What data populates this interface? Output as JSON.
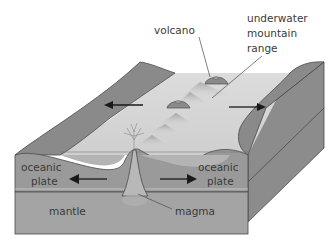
{
  "diagram": {
    "labels": {
      "volcano": "volcano",
      "mountain_range_line1": "underwater",
      "mountain_range_line2": "mountain",
      "mountain_range_line3": "range",
      "oceanic_plate_left_line1": "oceanic",
      "oceanic_plate_left_line2": "plate",
      "oceanic_plate_right_line1": "oceanic",
      "oceanic_plate_right_line2": "plate",
      "mantle": "mantle",
      "magma": "magma"
    },
    "arrows": [
      {
        "name": "surface-left",
        "direction": "left"
      },
      {
        "name": "surface-right",
        "direction": "right"
      },
      {
        "name": "plate-left",
        "direction": "left"
      },
      {
        "name": "plate-right",
        "direction": "right"
      }
    ],
    "colors": {
      "plate_top": "#8a8a8a",
      "plate_face": "#9a9a9a",
      "side_face": "#8c8c8c",
      "seafloor": "#d6d6d6",
      "mantle": "#a4a4a4",
      "magma": "#b8b8b8",
      "outline": "#4a4a4a",
      "text": "#3a3a3a",
      "arrow": "#1a1a1a"
    }
  }
}
